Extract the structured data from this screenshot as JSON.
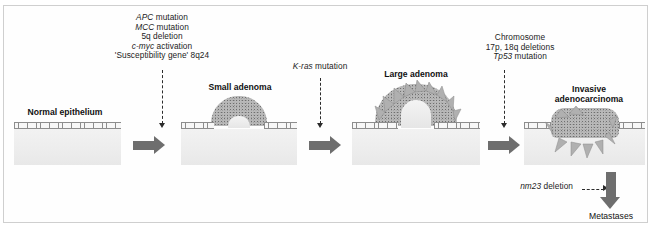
{
  "figure": {
    "stages": [
      {
        "id": "normal-epithelium",
        "label": "Normal epithelium"
      },
      {
        "id": "small-adenoma",
        "label": "Small adenoma"
      },
      {
        "id": "large-adenoma",
        "label": "Large adenoma"
      },
      {
        "id": "invasive-adenocarcinoma",
        "label_line1": "Invasive",
        "label_line2": "adenocarcinoma"
      }
    ],
    "annotations": [
      {
        "id": "apc-block",
        "lines": [
          {
            "gene": "APC",
            "text": " mutation"
          },
          {
            "gene": "MCC",
            "text": " mutation"
          },
          {
            "gene": "",
            "text": "5q deletion"
          },
          {
            "gene": "c-myc",
            "text": " activation"
          },
          {
            "gene": "",
            "text": "'Susceptibility gene' 8q24"
          }
        ]
      },
      {
        "id": "kras-block",
        "lines": [
          {
            "gene": "K-ras",
            "text": " mutation"
          }
        ]
      },
      {
        "id": "chromosome-block",
        "lines": [
          {
            "gene": "",
            "text": "Chromosome"
          },
          {
            "gene": "",
            "text": "17p, 18q deletions"
          },
          {
            "gene": "Tp53",
            "text": " mutation"
          }
        ]
      }
    ],
    "metastasis": {
      "gene": "nm23",
      "text": " deletion",
      "outcome_label": "Metastases"
    },
    "colors": {
      "tumour_fill": "#b9b9b9",
      "tissue_fill": "#ededed",
      "arrow_gray": "#6e6e6e",
      "dash_black": "#2b2b2b",
      "frame_border": "#cfcfcf"
    }
  }
}
